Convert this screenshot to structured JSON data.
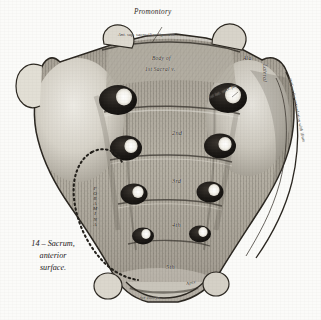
{
  "plate": {
    "title": "Sacrum, anterior surface",
    "figure_number": "14",
    "caption_lines": [
      "14 – Sacrum,",
      "anterior",
      "surface."
    ],
    "background_color": "#fbfbf9",
    "ink_color": "#2b2722",
    "technique": "steel engraving / stipple-and-line anatomical plate"
  },
  "labels": {
    "promontory": "Promontory",
    "anterior_ligament": "Ant. sup. sacro-iliac ligament",
    "body_line1": "Body of",
    "body_line2": "1st Sacral v.",
    "ala": "Ala",
    "first_lateral_foramen": "1st lat. sacr. for.",
    "lateral": "Lateral",
    "auricular_surface": "surface for articulation with ilium",
    "apex_label": "Apex",
    "coccyx_note": "for coccyx"
  },
  "vertebra_numbers": {
    "second": "2nd",
    "third": "3rd",
    "fourth": "4th",
    "fifth": "5th"
  },
  "vertical_label": {
    "text": "FORAMINA",
    "letters": [
      "F",
      "O",
      "R",
      "A",
      "M",
      "I",
      "N",
      "A"
    ]
  },
  "anatomy": {
    "foramina_rows": 4,
    "foramina_per_row": 2,
    "transverse_lines": 4,
    "dotted_outline": "auricular surface boundary"
  }
}
